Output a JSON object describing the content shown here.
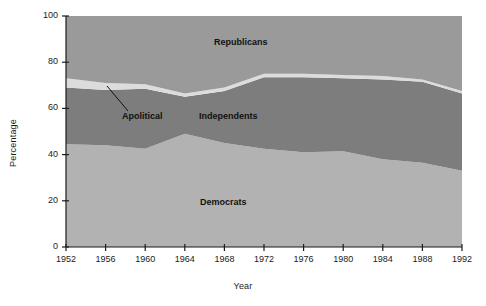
{
  "chart_data": {
    "type": "area",
    "stacked": true,
    "title": "",
    "xlabel": "Year",
    "ylabel": "Percentage",
    "xlim": [
      1952,
      1992
    ],
    "ylim": [
      0,
      100
    ],
    "grid": false,
    "legend_position": "inline-annotations",
    "xticks": [
      1952,
      1956,
      1960,
      1964,
      1968,
      1972,
      1976,
      1980,
      1984,
      1988,
      1992
    ],
    "yticks": [
      0,
      20,
      40,
      60,
      80,
      100
    ],
    "x": [
      1952,
      1956,
      1960,
      1964,
      1968,
      1972,
      1976,
      1980,
      1984,
      1988,
      1992
    ],
    "series": [
      {
        "name": "Democrats",
        "color": "#b2b2b2",
        "values": [
          44.5,
          44.0,
          42.5,
          49.0,
          45.0,
          42.5,
          41.0,
          41.5,
          38.0,
          36.5,
          33.0
        ]
      },
      {
        "name": "Independents",
        "color": "#7d7d7d",
        "values": [
          24.5,
          24.0,
          26.0,
          16.0,
          22.5,
          31.0,
          32.5,
          31.5,
          34.5,
          35.0,
          33.5
        ]
      },
      {
        "name": "Apolitical",
        "color": "#dcdcdc",
        "values": [
          4.0,
          3.0,
          2.0,
          1.5,
          1.5,
          1.5,
          1.5,
          1.5,
          1.5,
          1.0,
          1.0
        ]
      },
      {
        "name": "Republicans",
        "color": "#9a9a9a",
        "values": [
          27.0,
          29.0,
          29.5,
          33.5,
          31.0,
          25.0,
          25.0,
          25.5,
          26.0,
          27.5,
          32.5
        ]
      }
    ],
    "cumulative_boundaries": {
      "democrats_top": [
        44.5,
        44.0,
        42.5,
        49.0,
        45.0,
        42.5,
        41.0,
        41.5,
        38.0,
        36.5,
        33.0
      ],
      "independents_top": [
        69.0,
        68.0,
        68.5,
        65.0,
        67.5,
        73.5,
        73.5,
        73.0,
        72.5,
        71.5,
        66.5
      ],
      "apolitical_top": [
        73.0,
        71.0,
        70.5,
        66.5,
        69.0,
        75.0,
        75.0,
        74.5,
        74.0,
        72.5,
        67.5
      ]
    },
    "annotations": [
      {
        "text": "Republicans",
        "x_px": 214,
        "y_px": 43,
        "anchor": "start"
      },
      {
        "text": "Independents",
        "x_px": 199,
        "y_px": 117,
        "anchor": "start"
      },
      {
        "text": "Apolitical",
        "x_px": 122,
        "y_px": 117,
        "anchor": "start"
      },
      {
        "text": "Democrats",
        "x_px": 200,
        "y_px": 203,
        "anchor": "start"
      }
    ],
    "leader_line": {
      "from_x_px": 128,
      "from_y_px": 111,
      "to_x_px": 107,
      "to_y_px": 86
    }
  },
  "axes": {
    "y_title": "Percentage",
    "x_title": "Year",
    "y_tick_labels": [
      "0",
      "20",
      "40",
      "60",
      "80",
      "100"
    ],
    "x_tick_labels": [
      "1952",
      "1956",
      "1960",
      "1964",
      "1968",
      "1972",
      "1976",
      "1980",
      "1984",
      "1988",
      "1992"
    ]
  },
  "labels": {
    "republicans": "Republicans",
    "independents": "Independents",
    "apolitical": "Apolitical",
    "democrats": "Democrats"
  },
  "colors": {
    "democrats": "#b2b2b2",
    "independents": "#7d7d7d",
    "apolitical": "#dcdcdc",
    "republicans": "#9a9a9a",
    "axis": "#1b1b1b",
    "background": "#ffffff"
  }
}
